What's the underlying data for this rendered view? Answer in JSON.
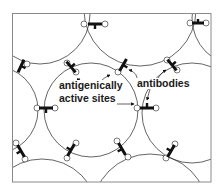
{
  "labels": {
    "sites_line1": "antigenically",
    "sites_line2": "active sites",
    "antibodies": "antibodies"
  },
  "colors": {
    "line": "#222222",
    "antibody": "#111111",
    "frame": "#8a8a8a",
    "background": "#ffffff"
  }
}
